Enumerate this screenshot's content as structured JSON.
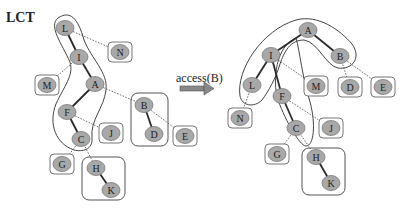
{
  "title": "LCT",
  "operation": {
    "label": "access(B)",
    "arrow": "right-arrow"
  },
  "colors": {
    "node_fill": "#a8a8a8",
    "node_stroke": "#7a7a7a",
    "edge": "#333333",
    "box": "#555555",
    "thick_edge": "#2a2a2a"
  },
  "before": {
    "nodes": [
      {
        "id": "L",
        "x": 65,
        "y": 28
      },
      {
        "id": "I",
        "x": 79,
        "y": 57
      },
      {
        "id": "A",
        "x": 95,
        "y": 84
      },
      {
        "id": "F",
        "x": 67,
        "y": 112
      },
      {
        "id": "C",
        "x": 81,
        "y": 139
      },
      {
        "id": "N",
        "x": 120,
        "y": 52,
        "boxed": true
      },
      {
        "id": "M",
        "x": 47,
        "y": 85,
        "boxed": true
      },
      {
        "id": "J",
        "x": 111,
        "y": 133,
        "boxed": true
      },
      {
        "id": "G",
        "x": 62,
        "y": 164,
        "boxed": true
      },
      {
        "id": "B",
        "x": 144,
        "y": 105
      },
      {
        "id": "D",
        "x": 154,
        "y": 134
      },
      {
        "id": "E",
        "x": 185,
        "y": 136,
        "boxed": true
      },
      {
        "id": "H",
        "x": 96,
        "y": 168
      },
      {
        "id": "K",
        "x": 111,
        "y": 190
      }
    ],
    "preferred_edges": [
      [
        "L",
        "I"
      ],
      [
        "I",
        "A"
      ],
      [
        "A",
        "F"
      ],
      [
        "F",
        "C"
      ],
      [
        "B",
        "D"
      ],
      [
        "H",
        "K"
      ]
    ],
    "path_parent_edges": [
      [
        "L",
        "N"
      ],
      [
        "I",
        "M"
      ],
      [
        "A",
        "B"
      ],
      [
        "B",
        "E"
      ],
      [
        "F",
        "J"
      ],
      [
        "C",
        "G"
      ],
      [
        "C",
        "H"
      ]
    ]
  },
  "after": {
    "nodes": [
      {
        "id": "A",
        "x": 308,
        "y": 30
      },
      {
        "id": "I",
        "x": 271,
        "y": 55
      },
      {
        "id": "B",
        "x": 340,
        "y": 56
      },
      {
        "id": "L",
        "x": 252,
        "y": 85
      },
      {
        "id": "F",
        "x": 282,
        "y": 96
      },
      {
        "id": "M",
        "x": 316,
        "y": 86,
        "boxed": true
      },
      {
        "id": "D",
        "x": 350,
        "y": 87,
        "boxed": true
      },
      {
        "id": "E",
        "x": 383,
        "y": 87,
        "boxed": true
      },
      {
        "id": "N",
        "x": 240,
        "y": 118,
        "boxed": true
      },
      {
        "id": "C",
        "x": 296,
        "y": 128
      },
      {
        "id": "J",
        "x": 331,
        "y": 128,
        "boxed": true
      },
      {
        "id": "G",
        "x": 277,
        "y": 154,
        "boxed": true
      },
      {
        "id": "H",
        "x": 316,
        "y": 157
      },
      {
        "id": "K",
        "x": 331,
        "y": 183
      }
    ],
    "preferred_edges": [
      [
        "A",
        "I"
      ],
      [
        "A",
        "B"
      ],
      [
        "I",
        "L"
      ],
      [
        "I",
        "F"
      ],
      [
        "F",
        "C"
      ],
      [
        "H",
        "K"
      ]
    ],
    "path_parent_edges": [
      [
        "I",
        "M"
      ],
      [
        "B",
        "D"
      ],
      [
        "B",
        "E"
      ],
      [
        "L",
        "N"
      ],
      [
        "F",
        "J"
      ],
      [
        "C",
        "G"
      ],
      [
        "C",
        "H"
      ]
    ]
  }
}
